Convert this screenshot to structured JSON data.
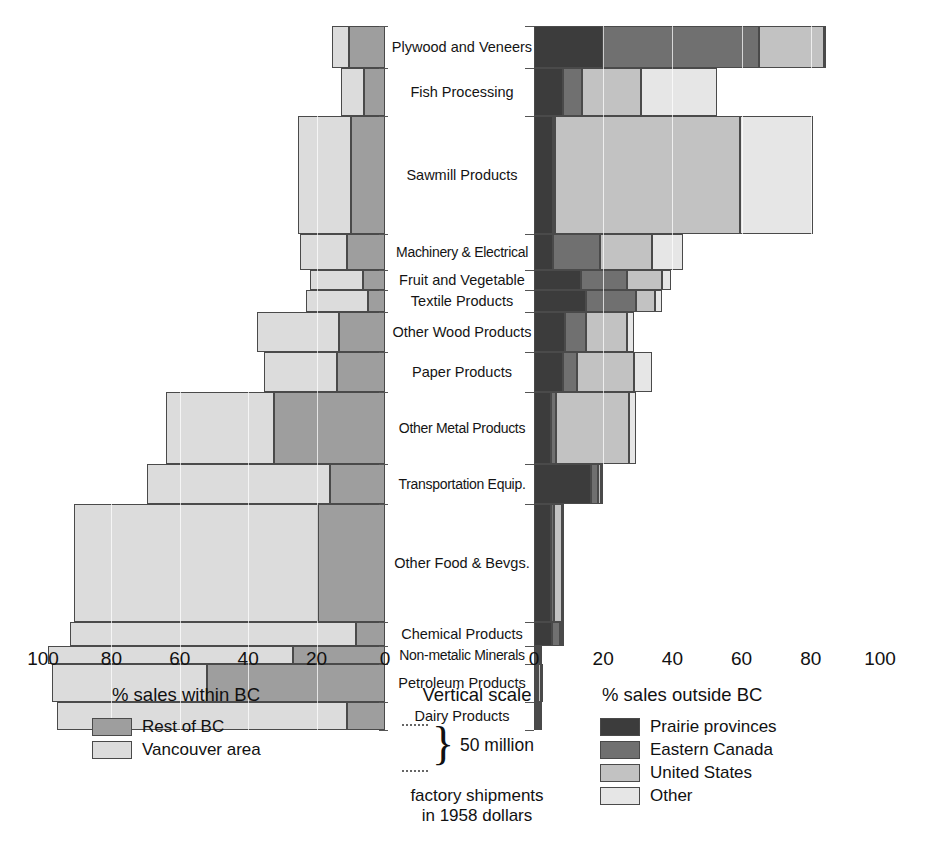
{
  "chart_data": {
    "type": "bar",
    "subtype": "bidirectional-stacked-bar",
    "title": "",
    "xlabel_left": "% sales within BC",
    "xlabel_right": "% sales outside BC",
    "ylabel": "factory shipments in 1958 dollars",
    "xlim_left": [
      0,
      100
    ],
    "xlim_right": [
      0,
      100
    ],
    "xticks_left": [
      "100",
      "80",
      "60",
      "40",
      "20",
      "0"
    ],
    "xticks_right": [
      "0",
      "20",
      "40",
      "60",
      "80",
      "100"
    ],
    "grid": true,
    "legend_position": "below",
    "vertical_scale_note": "bar height encodes factory shipments; 50 million per bracket",
    "categories": [
      "Plywood and Veneers",
      "Fish Processing",
      "Sawmill Products",
      "Machinery & Electrical",
      "Fruit and Vegetable",
      "Textile Products",
      "Other Wood Products",
      "Paper Products",
      "Other Metal Products",
      "Transportation Equip.",
      "Other Food & Bevgs.",
      "Chemical Products",
      "Non-metalic Minerals",
      "Petroleum Products",
      "Dairy Products"
    ],
    "series_left": [
      {
        "name": "Rest of BC",
        "color": "#9e9e9e",
        "values": [
          10.5,
          6.0,
          10.0,
          11.0,
          6.5,
          5.0,
          13.5,
          14.0,
          32.5,
          16.0,
          19.5,
          8.5,
          27.0,
          52.0,
          11.0
        ]
      },
      {
        "name": "Vancouver area",
        "color": "#dcdcdc",
        "values": [
          5.0,
          7.0,
          15.5,
          14.0,
          15.5,
          18.0,
          24.0,
          21.5,
          31.5,
          53.5,
          71.5,
          83.5,
          71.5,
          45.5,
          85.0
        ]
      }
    ],
    "series_right": [
      {
        "name": "Prairie provinces",
        "color": "#3c3c3c",
        "values": [
          20.0,
          8.5,
          5.5,
          5.5,
          13.5,
          15.0,
          9.0,
          8.5,
          5.0,
          16.5,
          5.0,
          5.5,
          1.0,
          0.2,
          1.0
        ]
      },
      {
        "name": "Eastern Canada",
        "color": "#707070",
        "values": [
          45.0,
          5.5,
          0.5,
          13.5,
          13.5,
          14.5,
          6.0,
          4.0,
          1.5,
          2.0,
          0.8,
          2.5,
          0.4,
          0.2,
          0.5
        ]
      },
      {
        "name": "United States",
        "color": "#c2c2c2",
        "values": [
          19.0,
          17.0,
          53.5,
          15.0,
          10.0,
          5.5,
          12.0,
          16.5,
          21.0,
          1.0,
          2.5,
          0.5,
          0.3,
          2.0,
          0.6
        ]
      },
      {
        "name": "Other",
        "color": "#e6e6e6",
        "values": [
          0.5,
          22.0,
          21.0,
          9.0,
          2.5,
          2.0,
          2.0,
          5.0,
          2.0,
          0.5,
          0.5,
          0.3,
          0.2,
          0.3,
          0.3
        ]
      }
    ],
    "row_heights_px": [
      42,
      48,
      118,
      36,
      20,
      22,
      40,
      40,
      72,
      40,
      118,
      24,
      18,
      38,
      28
    ]
  },
  "axes": {
    "left_ticks": [
      "100",
      "80",
      "60",
      "40",
      "20",
      "0"
    ],
    "right_ticks": [
      "0",
      "20",
      "40",
      "60",
      "80",
      "100"
    ]
  },
  "legend_left": {
    "heading": "% sales within BC",
    "items": [
      {
        "label": "Rest of BC",
        "color": "#9e9e9e"
      },
      {
        "label": "Vancouver area",
        "color": "#dcdcdc"
      }
    ]
  },
  "legend_mid": {
    "heading": "Vertical scale",
    "bracket_label": "50 million",
    "note_line1": "factory shipments",
    "note_line2": "in 1958 dollars"
  },
  "legend_right": {
    "heading": "% sales outside BC",
    "items": [
      {
        "label": "Prairie provinces",
        "color": "#3c3c3c"
      },
      {
        "label": "Eastern Canada",
        "color": "#707070"
      },
      {
        "label": "United States",
        "color": "#c2c2c2"
      },
      {
        "label": "Other",
        "color": "#e6e6e6"
      }
    ]
  }
}
